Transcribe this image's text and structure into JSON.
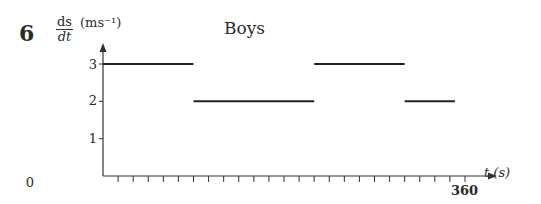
{
  "question_number": "6",
  "chart_data": {
    "type": "line",
    "subtype": "step",
    "title": "Boys",
    "ylabel": "ds/dt (m s^-1)",
    "ylabel_parts": {
      "numerator": "ds",
      "denominator": "dt",
      "unit": "(ms⁻¹)"
    },
    "xlabel": "t (s)",
    "yticks": [
      "0",
      "1",
      "2",
      "3"
    ],
    "xticks_labeled": [
      "360"
    ],
    "x_minor_tick_interval": 15,
    "xlim": [
      0,
      360
    ],
    "ylim": [
      0,
      3
    ],
    "grid": false,
    "legend": null,
    "segments": [
      {
        "x_start": 0,
        "x_end": 90,
        "y": 3
      },
      {
        "x_start": 90,
        "x_end": 210,
        "y": 2
      },
      {
        "x_start": 210,
        "x_end": 300,
        "y": 3
      },
      {
        "x_start": 300,
        "x_end": 350,
        "y": 2
      }
    ],
    "colors": {
      "axis": "#333333",
      "line": "#222222"
    }
  }
}
